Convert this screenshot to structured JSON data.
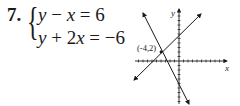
{
  "problem": {
    "number": "7.",
    "equations": [
      {
        "text": "y − x = 6",
        "lhs_var1": "y",
        "op": " − ",
        "lhs_var2": "x",
        "rhs": " = 6"
      },
      {
        "text": "y + 2x = −6",
        "lhs_var1": "y",
        "op": " + 2",
        "lhs_var2": "x",
        "rhs": " = −6"
      }
    ]
  },
  "graph": {
    "x_axis_label": "x",
    "y_axis_label": "y",
    "intersection_label": "(-4,2)",
    "intersection": {
      "x": -4,
      "y": 2
    },
    "lines": [
      {
        "equation": "y = x + 6"
      },
      {
        "equation": "y = -2x - 6"
      }
    ],
    "colors": {
      "ink": "#1a1a1a"
    }
  }
}
